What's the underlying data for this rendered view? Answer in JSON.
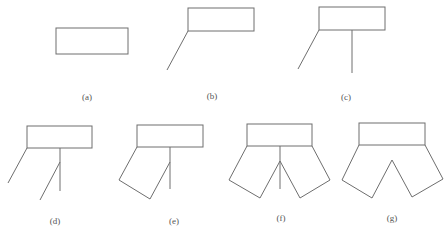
{
  "figure": {
    "panels": [
      {
        "id": "a",
        "label": "(a)"
      },
      {
        "id": "b",
        "label": "(b)"
      },
      {
        "id": "c",
        "label": "(c)"
      },
      {
        "id": "d",
        "label": "(d)"
      },
      {
        "id": "e",
        "label": "(e)"
      },
      {
        "id": "f",
        "label": "(f)"
      },
      {
        "id": "g",
        "label": "(g)"
      }
    ],
    "stroke_color": "#6e6e6e",
    "label_color": "#555555"
  }
}
